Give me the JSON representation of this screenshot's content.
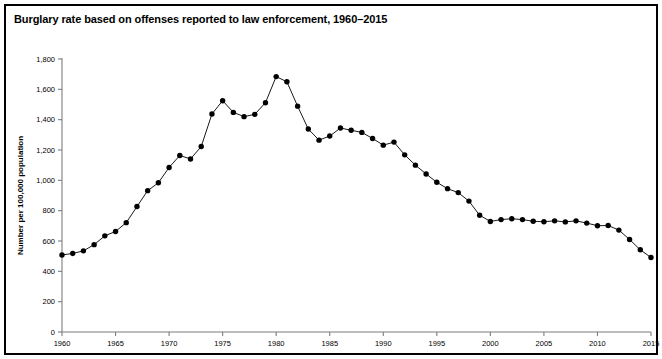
{
  "figure": {
    "title": "Burglary rate based on offenses reported to law enforcement, 1960–2015",
    "border_color": "#000000",
    "background_color": "#ffffff"
  },
  "chart_data": {
    "type": "line",
    "title": "Burglary rate based on offenses reported to law enforcement, 1960–2015",
    "xlabel": "",
    "ylabel": "Number per 100,000 population",
    "xlim": [
      1960,
      2015
    ],
    "ylim": [
      0,
      1800
    ],
    "ytick_step": 200,
    "xtick_step": 5,
    "grid": false,
    "legend": false,
    "marker": "circle",
    "line_color": "#1a1a1a",
    "marker_color": "#000000",
    "ytick_labels": [
      "0",
      "200",
      "400",
      "600",
      "800",
      "1,000",
      "1,200",
      "1,400",
      "1,600",
      "1,800"
    ],
    "ytick_values": [
      0,
      200,
      400,
      600,
      800,
      1000,
      1200,
      1400,
      1600,
      1800
    ],
    "xtick_labels": [
      "1960",
      "1965",
      "1970",
      "1975",
      "1980",
      "1985",
      "1990",
      "1995",
      "2000",
      "2005",
      "2010",
      "2015"
    ],
    "xtick_values": [
      1960,
      1965,
      1970,
      1975,
      1980,
      1985,
      1990,
      1995,
      2000,
      2005,
      2010,
      2015
    ],
    "x": [
      1960,
      1961,
      1962,
      1963,
      1964,
      1965,
      1966,
      1967,
      1968,
      1969,
      1970,
      1971,
      1972,
      1973,
      1974,
      1975,
      1976,
      1977,
      1978,
      1979,
      1980,
      1981,
      1982,
      1983,
      1984,
      1985,
      1986,
      1987,
      1988,
      1989,
      1990,
      1991,
      1992,
      1993,
      1994,
      1995,
      1996,
      1997,
      1998,
      1999,
      2000,
      2001,
      2002,
      2003,
      2004,
      2005,
      2006,
      2007,
      2008,
      2009,
      2010,
      2011,
      2012,
      2013,
      2014,
      2015
    ],
    "values": [
      508,
      518,
      535,
      576,
      634,
      663,
      721,
      827,
      932,
      984,
      1085,
      1164,
      1141,
      1223,
      1437,
      1525,
      1448,
      1420,
      1435,
      1512,
      1684,
      1650,
      1489,
      1338,
      1265,
      1292,
      1345,
      1330,
      1316,
      1276,
      1232,
      1252,
      1168,
      1100,
      1042,
      987,
      945,
      919,
      863,
      770,
      729,
      741,
      747,
      741,
      730,
      727,
      733,
      726,
      733,
      718,
      701,
      702,
      672,
      610,
      542,
      491
    ],
    "annotations": []
  }
}
